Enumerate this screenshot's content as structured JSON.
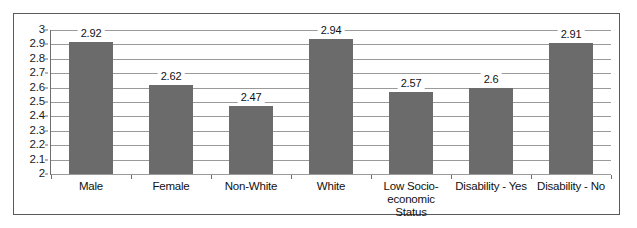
{
  "chart_data": {
    "type": "bar",
    "title": "",
    "subtitle": "",
    "xlabel": "",
    "ylabel": "",
    "categories": [
      "Male",
      "Female",
      "Non-White",
      "White",
      "Low Socio-economic Status",
      "Disability - Yes",
      "Disability - No"
    ],
    "category_lines": [
      [
        "Male"
      ],
      [
        "Female"
      ],
      [
        "Non-White"
      ],
      [
        "White"
      ],
      [
        "Low Socio-",
        "economic Status"
      ],
      [
        "Disability - Yes"
      ],
      [
        "Disability - No"
      ]
    ],
    "values": [
      2.92,
      2.62,
      2.47,
      2.94,
      2.57,
      2.6,
      2.91
    ],
    "data_labels": [
      "2.92",
      "2.62",
      "2.47",
      "2.94",
      "2.57",
      "2.6",
      "2.91"
    ],
    "ylim": [
      2,
      3
    ],
    "ytick_step": 0.1,
    "ytick_labels": [
      "3",
      "2.9",
      "2.8",
      "2.7",
      "2.6",
      "2.5",
      "2.4",
      "2.3",
      "2.2",
      "2.1",
      "2"
    ],
    "ytick_values": [
      3,
      2.9,
      2.8,
      2.7,
      2.6,
      2.5,
      2.4,
      2.3,
      2.2,
      2.1,
      2
    ],
    "grid": true,
    "grid_axis": "y",
    "legend": false,
    "legend_position": "none",
    "series": [
      {
        "name": "",
        "values": [
          2.92,
          2.62,
          2.47,
          2.94,
          2.57,
          2.6,
          2.91
        ]
      }
    ]
  },
  "style": {
    "bar_color": "#6b6b6b",
    "grid_color": "#9a9a9a",
    "axis_color": "#6e6e6e",
    "frame_color": "#5a5a5a",
    "background": "#ffffff",
    "text_color": "#111111"
  }
}
